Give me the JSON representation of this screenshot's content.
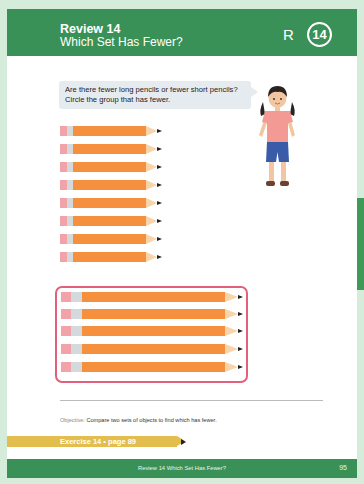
{
  "header": {
    "title": "Review 14",
    "subtitle": "Which Set Has Fewer?",
    "badge_letter": "R",
    "badge_number": "14",
    "color": "#3a9157"
  },
  "prompt": {
    "line1": "Are there fewer long pencils or fewer short pencils?",
    "line2": "Circle the group that has fewer."
  },
  "illustration": {
    "character": "girl-icon",
    "shirt_color": "#f29a93",
    "shorts_color": "#3a5ba8"
  },
  "short_pencils": {
    "count": 8,
    "tops": [
      126,
      144,
      162,
      180,
      198,
      216,
      234,
      252
    ]
  },
  "long_pencils": {
    "count": 5,
    "circled": true,
    "tops": [
      292,
      309,
      326,
      344,
      362
    ],
    "circle_color": "#e26079"
  },
  "objective": {
    "label": "Objective:",
    "text": "Compare two sets of objects to find which has fewer."
  },
  "exercise": {
    "label": "Exercise 14 • page 89"
  },
  "footer": {
    "title": "Review 14  Which Set Has Fewer?",
    "page_number": "95"
  }
}
